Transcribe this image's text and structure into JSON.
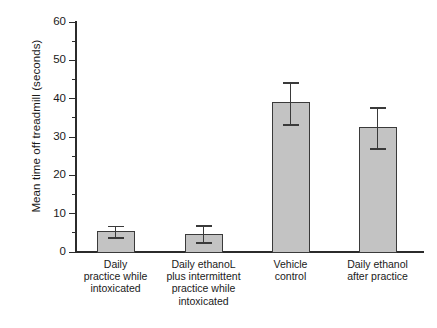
{
  "chart_data": {
    "type": "bar",
    "title": "",
    "xlabel": "",
    "ylabel": "Mean time off treadmill (seconds)",
    "ylim": [
      0,
      60
    ],
    "ytick_labels": [
      "0",
      "10",
      "20",
      "30",
      "40",
      "50",
      "60"
    ],
    "ytick_values": [
      0,
      10,
      20,
      30,
      40,
      50,
      60
    ],
    "yminor_tick_values": [
      5,
      15,
      25,
      35,
      45,
      55
    ],
    "grid": false,
    "legend": null,
    "bar_fill_color": "#c3c3c3",
    "bar_edge_color": "#3a3a3a",
    "categories": [
      "Daily\npractice while\nintoxicated",
      "Daily ethanoL\nplus intermittent\npractice while\nintoxicated",
      "Vehicle\ncontrol",
      "Daily ethanol\nafter practice"
    ],
    "category_lines": [
      [
        "Daily",
        "practice while",
        "intoxicated"
      ],
      [
        "Daily ethanoL",
        "plus intermittent",
        "practice while",
        "intoxicated"
      ],
      [
        "Vehicle",
        "control"
      ],
      [
        "Daily ethanol",
        "after practice"
      ]
    ],
    "values": [
      5.5,
      4.7,
      39.2,
      32.5
    ],
    "error_upper": [
      6.9,
      7.0,
      44.3,
      37.7
    ],
    "error_lower": [
      3.8,
      2.6,
      33.3,
      27.1
    ],
    "series": [
      {
        "name": "Mean time off treadmill",
        "values": [
          5.5,
          4.7,
          39.2,
          32.5
        ]
      }
    ]
  },
  "axis": {
    "y_title": "Mean time off treadmill (seconds)"
  }
}
